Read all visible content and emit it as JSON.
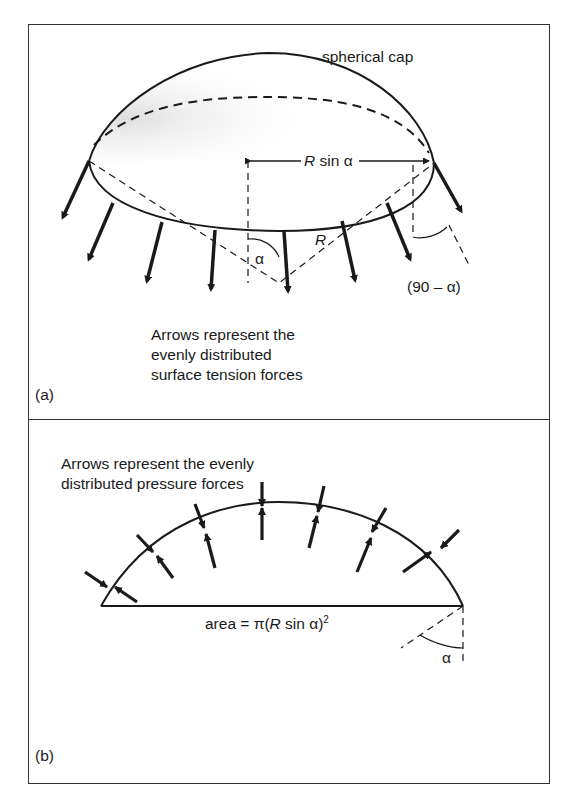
{
  "figure": {
    "panel_a": {
      "tag": "(a)",
      "cap_label": "spherical cap",
      "radius_projection_label": {
        "var": "R",
        "rest": " sin α"
      },
      "radius_label": "R",
      "angle_label": "α",
      "complement_angle_label": "(90  –  α)",
      "caption_lines": [
        "Arrows represent the",
        "evenly distributed",
        "surface tension forces"
      ]
    },
    "panel_b": {
      "tag": "(b)",
      "caption_lines": [
        "Arrows represent the evenly",
        "distributed pressure forces"
      ],
      "area_label": {
        "prefix": "area  =  π(",
        "var": "R",
        "mid": " sin α)",
        "sup": "2"
      },
      "angle_label": "α"
    }
  },
  "diagram_data": {
    "type": "physics-diagram",
    "panels": [
      {
        "id": "a",
        "subject": "spherical cap with surface tension forces along its rim",
        "elements": [
          "spherical cap outline",
          "dashed hidden rim",
          "rim ellipse",
          "10 outward tension arrows",
          "R sin α dimension",
          "radius R",
          "angle α",
          "angle (90 – α)"
        ]
      },
      {
        "id": "b",
        "subject": "cross-section of cap with pressure forces",
        "elements": [
          "arc",
          "base chord",
          "7 pairs of opposing pressure arrows",
          "area = π(R sin α)^2",
          "angle α"
        ]
      }
    ]
  }
}
